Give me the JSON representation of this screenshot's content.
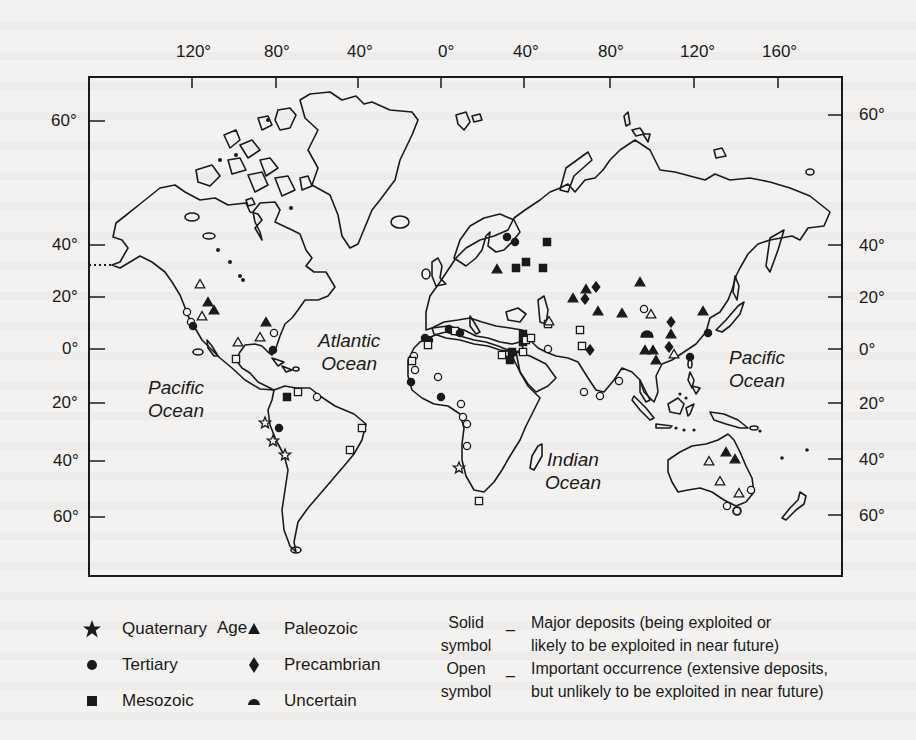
{
  "map": {
    "frame": {
      "x": 89,
      "y": 77,
      "width": 753,
      "height": 499,
      "stroke": "#1a1a1a"
    },
    "longitude_labels": [
      {
        "label": "120°",
        "x": 148
      },
      {
        "label": "80°",
        "x": 208
      },
      {
        "label": "40°",
        "x": 262
      },
      {
        "label": "0°",
        "x": 320
      },
      {
        "label": "40°",
        "x": 372
      },
      {
        "label": "80°",
        "x": 427
      },
      {
        "label": "120°",
        "x": 480
      },
      {
        "label": "160°",
        "x": 532
      }
    ],
    "latitude_labels_left": [
      {
        "label": "60°",
        "y": 121
      },
      {
        "label": "40°",
        "y": 245
      },
      {
        "label": "20°",
        "y": 297
      },
      {
        "label": "0°",
        "y": 349
      },
      {
        "label": "20°",
        "y": 403
      },
      {
        "label": "40°",
        "y": 461
      },
      {
        "label": "60°",
        "y": 517
      }
    ],
    "latitude_labels_right": [
      {
        "label": "60°",
        "y": 115
      },
      {
        "label": "40°",
        "y": 245
      },
      {
        "label": "20°",
        "y": 297
      },
      {
        "label": "0°",
        "y": 349
      },
      {
        "label": "20°",
        "y": 403
      },
      {
        "label": "40°",
        "y": 459
      },
      {
        "label": "60°",
        "y": 515
      }
    ],
    "oceans": [
      {
        "name": "Pacific Ocean",
        "line1": "Pacific",
        "line2": "Ocean",
        "x": 148,
        "y": 378
      },
      {
        "name": "Atlantic Ocean",
        "line1": "Atlantic",
        "line2": "Ocean",
        "x": 318,
        "y": 325
      },
      {
        "name": "Indian Ocean",
        "line1": "Indian",
        "line2": "Ocean",
        "x": 545,
        "y": 447
      },
      {
        "name": "Pacific Ocean East",
        "line1": "Pacific",
        "line2": "Ocean",
        "x": 729,
        "y": 348
      }
    ],
    "deposits": [
      {
        "type": "triangle",
        "filled": false,
        "x": 200,
        "y": 284
      },
      {
        "type": "triangle",
        "filled": true,
        "x": 208,
        "y": 302
      },
      {
        "type": "triangle",
        "filled": true,
        "x": 214,
        "y": 310
      },
      {
        "type": "triangle",
        "filled": false,
        "x": 202,
        "y": 316
      },
      {
        "type": "circle",
        "filled": false,
        "x": 187,
        "y": 312
      },
      {
        "type": "circle",
        "filled": false,
        "x": 191,
        "y": 322
      },
      {
        "type": "circle",
        "filled": true,
        "x": 193,
        "y": 326
      },
      {
        "type": "triangle",
        "filled": true,
        "x": 266,
        "y": 322
      },
      {
        "type": "triangle",
        "filled": false,
        "x": 260,
        "y": 337
      },
      {
        "type": "triangle",
        "filled": false,
        "x": 238,
        "y": 342
      },
      {
        "type": "circle",
        "filled": false,
        "x": 274,
        "y": 333
      },
      {
        "type": "circle",
        "filled": true,
        "x": 273,
        "y": 350
      },
      {
        "type": "square",
        "filled": false,
        "x": 236,
        "y": 359
      },
      {
        "type": "square",
        "filled": true,
        "x": 287,
        "y": 397
      },
      {
        "type": "square",
        "filled": false,
        "x": 298,
        "y": 392
      },
      {
        "type": "circle",
        "filled": false,
        "x": 317,
        "y": 397
      },
      {
        "type": "star",
        "filled": false,
        "x": 265,
        "y": 423
      },
      {
        "type": "circle",
        "filled": true,
        "x": 279,
        "y": 428
      },
      {
        "type": "star",
        "filled": false,
        "x": 273,
        "y": 441
      },
      {
        "type": "star",
        "filled": false,
        "x": 285,
        "y": 455
      },
      {
        "type": "square",
        "filled": false,
        "x": 362,
        "y": 428
      },
      {
        "type": "square",
        "filled": false,
        "x": 350,
        "y": 450
      },
      {
        "type": "circle",
        "filled": true,
        "x": 507,
        "y": 237
      },
      {
        "type": "circle",
        "filled": true,
        "x": 515,
        "y": 242
      },
      {
        "type": "square",
        "filled": true,
        "x": 547,
        "y": 242
      },
      {
        "type": "triangle",
        "filled": true,
        "x": 497,
        "y": 269
      },
      {
        "type": "square",
        "filled": true,
        "x": 516,
        "y": 268
      },
      {
        "type": "square",
        "filled": true,
        "x": 526,
        "y": 262
      },
      {
        "type": "square",
        "filled": true,
        "x": 543,
        "y": 268
      },
      {
        "type": "triangle",
        "filled": true,
        "x": 586,
        "y": 289
      },
      {
        "type": "diamond",
        "filled": true,
        "x": 596,
        "y": 287
      },
      {
        "type": "triangle",
        "filled": true,
        "x": 573,
        "y": 298
      },
      {
        "type": "diamond",
        "filled": true,
        "x": 585,
        "y": 299
      },
      {
        "type": "triangle",
        "filled": true,
        "x": 598,
        "y": 311
      },
      {
        "type": "triangle",
        "filled": true,
        "x": 640,
        "y": 282
      },
      {
        "type": "triangle",
        "filled": true,
        "x": 622,
        "y": 313
      },
      {
        "type": "circle",
        "filled": false,
        "x": 644,
        "y": 309
      },
      {
        "type": "triangle",
        "filled": false,
        "x": 651,
        "y": 314
      },
      {
        "type": "diamond",
        "filled": true,
        "x": 671,
        "y": 322
      },
      {
        "type": "triangle",
        "filled": true,
        "x": 671,
        "y": 334
      },
      {
        "type": "diamond",
        "filled": true,
        "x": 669,
        "y": 347
      },
      {
        "type": "triangle",
        "filled": false,
        "x": 674,
        "y": 354
      },
      {
        "type": "uncertain",
        "filled": true,
        "x": 647,
        "y": 334
      },
      {
        "type": "triangle",
        "filled": true,
        "x": 645,
        "y": 350
      },
      {
        "type": "triangle",
        "filled": true,
        "x": 653,
        "y": 350
      },
      {
        "type": "triangle",
        "filled": true,
        "x": 656,
        "y": 360
      },
      {
        "type": "triangle",
        "filled": true,
        "x": 703,
        "y": 311
      },
      {
        "type": "circle",
        "filled": true,
        "x": 708,
        "y": 333
      },
      {
        "type": "circle",
        "filled": true,
        "x": 690,
        "y": 357
      },
      {
        "type": "square",
        "filled": false,
        "x": 580,
        "y": 330
      },
      {
        "type": "square",
        "filled": false,
        "x": 582,
        "y": 346
      },
      {
        "type": "diamond",
        "filled": true,
        "x": 590,
        "y": 350
      },
      {
        "type": "square",
        "filled": false,
        "x": 548,
        "y": 324
      },
      {
        "type": "triangle",
        "filled": false,
        "x": 549,
        "y": 321
      },
      {
        "type": "square",
        "filled": true,
        "x": 523,
        "y": 334
      },
      {
        "type": "square",
        "filled": true,
        "x": 523,
        "y": 342
      },
      {
        "type": "square",
        "filled": false,
        "x": 526,
        "y": 340
      },
      {
        "type": "square",
        "filled": false,
        "x": 531,
        "y": 338
      },
      {
        "type": "square",
        "filled": true,
        "x": 512,
        "y": 352
      },
      {
        "type": "square",
        "filled": false,
        "x": 502,
        "y": 355
      },
      {
        "type": "square",
        "filled": true,
        "x": 510,
        "y": 360
      },
      {
        "type": "square",
        "filled": false,
        "x": 523,
        "y": 352
      },
      {
        "type": "circle",
        "filled": false,
        "x": 548,
        "y": 349
      },
      {
        "type": "circle",
        "filled": true,
        "x": 425,
        "y": 338
      },
      {
        "type": "circle",
        "filled": true,
        "x": 429,
        "y": 340
      },
      {
        "type": "square",
        "filled": false,
        "x": 428,
        "y": 345
      },
      {
        "type": "circle",
        "filled": true,
        "x": 449,
        "y": 329
      },
      {
        "type": "square",
        "filled": false,
        "x": 455,
        "y": 331
      },
      {
        "type": "circle",
        "filled": true,
        "x": 460,
        "y": 333
      },
      {
        "type": "circle",
        "filled": false,
        "x": 414,
        "y": 356
      },
      {
        "type": "square",
        "filled": false,
        "x": 412,
        "y": 361
      },
      {
        "type": "circle",
        "filled": false,
        "x": 415,
        "y": 370
      },
      {
        "type": "circle",
        "filled": true,
        "x": 411,
        "y": 382
      },
      {
        "type": "circle",
        "filled": false,
        "x": 438,
        "y": 377
      },
      {
        "type": "circle",
        "filled": true,
        "x": 441,
        "y": 397
      },
      {
        "type": "circle",
        "filled": false,
        "x": 461,
        "y": 404
      },
      {
        "type": "circle",
        "filled": false,
        "x": 463,
        "y": 417
      },
      {
        "type": "circle",
        "filled": false,
        "x": 467,
        "y": 424
      },
      {
        "type": "circle",
        "filled": false,
        "x": 467,
        "y": 446
      },
      {
        "type": "star",
        "filled": false,
        "x": 459,
        "y": 468
      },
      {
        "type": "square",
        "filled": false,
        "x": 479,
        "y": 501
      },
      {
        "type": "circle",
        "filled": false,
        "x": 584,
        "y": 392
      },
      {
        "type": "circle",
        "filled": false,
        "x": 600,
        "y": 396
      },
      {
        "type": "circle",
        "filled": false,
        "x": 619,
        "y": 381
      },
      {
        "type": "triangle",
        "filled": true,
        "x": 726,
        "y": 452
      },
      {
        "type": "triangle",
        "filled": true,
        "x": 735,
        "y": 459
      },
      {
        "type": "triangle",
        "filled": false,
        "x": 709,
        "y": 461
      },
      {
        "type": "triangle",
        "filled": false,
        "x": 720,
        "y": 481
      },
      {
        "type": "triangle",
        "filled": false,
        "x": 739,
        "y": 493
      },
      {
        "type": "circle",
        "filled": false,
        "x": 751,
        "y": 490
      },
      {
        "type": "circle",
        "filled": false,
        "x": 727,
        "y": 506
      },
      {
        "type": "circle",
        "filled": false,
        "x": 737,
        "y": 511
      }
    ]
  },
  "legend": {
    "title": "Age",
    "items": [
      {
        "symbol": "star",
        "label": "Quaternary"
      },
      {
        "symbol": "circle",
        "label": "Tertiary"
      },
      {
        "symbol": "square",
        "label": "Mesozoic"
      },
      {
        "symbol": "triangle",
        "label": "Paleozoic"
      },
      {
        "symbol": "diamond",
        "label": "Precambrian"
      },
      {
        "symbol": "uncertain",
        "label": "Uncertain"
      }
    ],
    "notes": [
      {
        "label_line1": "Solid",
        "label_line2": "symbol",
        "dash": "_",
        "desc_line1": "Major deposits (being exploited or",
        "desc_line2": "likely to be exploited in near future)"
      },
      {
        "label_line1": "Open",
        "label_line2": "symbol",
        "dash": "_",
        "desc_line1": "Important occurrence (extensive deposits,",
        "desc_line2": "but unlikely to be exploited in near future)"
      }
    ]
  }
}
